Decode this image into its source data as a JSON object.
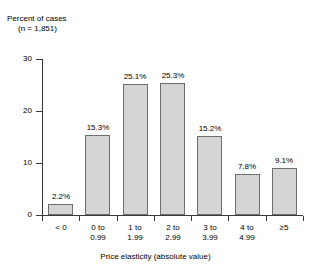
{
  "chart_data": {
    "type": "bar",
    "title": "",
    "ylabel": "Percent of cases",
    "ylabel_line2": "(n = 1,851)",
    "xlabel": "Price elasticity (absolute value)",
    "categories": [
      "< 0",
      "0 to 0.99",
      "1 to 1.99",
      "2 to 2.99",
      "3 to 3.99",
      "4 to 4.99",
      "≥5"
    ],
    "category_lines": [
      [
        "< 0",
        ""
      ],
      [
        "0 to",
        "0.99"
      ],
      [
        "1 to",
        "1.99"
      ],
      [
        "2 to",
        "2.99"
      ],
      [
        "3 to",
        "3.99"
      ],
      [
        "4 to",
        "4.99"
      ],
      [
        "≥5",
        ""
      ]
    ],
    "values": [
      2.2,
      15.3,
      25.1,
      25.3,
      15.2,
      7.8,
      9.1
    ],
    "value_labels": [
      "2.2%",
      "15.3%",
      "25.1%",
      "25.3%",
      "15.2%",
      "7.8%",
      "9.1%"
    ],
    "ylim": [
      0,
      30
    ],
    "yticks": [
      0,
      10,
      20,
      30
    ],
    "ytick_labels": [
      "0",
      "10",
      "20",
      "30"
    ],
    "grid": false,
    "legend": false,
    "sample_size": "n = 1,851",
    "colors": {
      "bar_fill": "#d4d4d4",
      "bar_border": "#6e6e6e",
      "axis": "#3a3a3a",
      "text": "#000000",
      "background": "#ffffff"
    }
  }
}
